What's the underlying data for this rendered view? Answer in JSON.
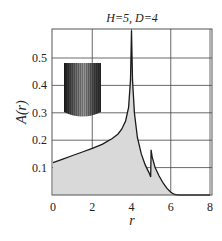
{
  "chart_data": {
    "type": "area",
    "title": "H=5, D=4",
    "xlabel": "r",
    "ylabel": "A(r)",
    "xlim": [
      0,
      8
    ],
    "ylim": [
      0,
      0.6
    ],
    "xticks": [
      0,
      2,
      4,
      6,
      8
    ],
    "yticks": [
      0.1,
      0.2,
      0.3,
      0.4,
      0.5
    ],
    "xtick_labels": [
      "0",
      "2",
      "4",
      "6",
      "8"
    ],
    "ytick_labels": [
      "0.1",
      "0.2",
      "0.3",
      "0.4",
      "0.5"
    ],
    "grid": true,
    "fill_color": "#d9d9d9",
    "line_color": "#1a1a1a",
    "inset": "cylinder-icon",
    "series": [
      {
        "name": "A(r)",
        "x": [
          0,
          0.5,
          1,
          1.5,
          2,
          2.5,
          3,
          3.3,
          3.5,
          3.7,
          3.85,
          3.95,
          4.0,
          4.05,
          4.15,
          4.3,
          4.5,
          4.7,
          4.9,
          4.98,
          5.0,
          5.05,
          5.2,
          5.4,
          5.6,
          5.8,
          6.0,
          6.2,
          6.4,
          7.0,
          8.0
        ],
        "y": [
          0.118,
          0.131,
          0.144,
          0.157,
          0.17,
          0.185,
          0.205,
          0.222,
          0.24,
          0.27,
          0.32,
          0.42,
          0.6,
          0.42,
          0.3,
          0.21,
          0.15,
          0.11,
          0.08,
          0.066,
          0.165,
          0.14,
          0.1,
          0.07,
          0.045,
          0.025,
          0.01,
          0.002,
          0.0,
          0.0,
          0.0
        ]
      }
    ]
  }
}
